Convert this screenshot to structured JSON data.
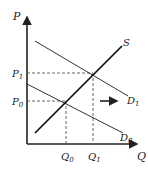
{
  "diagram": {
    "axes": {
      "y_label": "P",
      "x_label": "Q"
    },
    "curves": {
      "supply": "S",
      "demand_initial": "D",
      "demand_initial_sub": "0",
      "demand_shifted": "D",
      "demand_shifted_sub": "1"
    },
    "price_ticks": [
      {
        "label": "P",
        "sub": "1"
      },
      {
        "label": "P",
        "sub": "0"
      }
    ],
    "quantity_ticks": [
      {
        "label": "Q",
        "sub": "0"
      },
      {
        "label": "Q",
        "sub": "1"
      }
    ],
    "annotation": "rightward shift arrow"
  },
  "colors": {
    "line": "#222222",
    "dashed": "#555555",
    "background": "#ffffff"
  }
}
